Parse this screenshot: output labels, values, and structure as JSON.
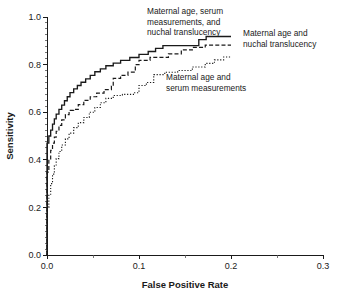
{
  "chart_data": {
    "type": "line",
    "title": "",
    "xlabel": "False Positive Rate",
    "ylabel": "Sensitivity",
    "xlim": [
      0.0,
      0.3
    ],
    "ylim": [
      0.0,
      1.0
    ],
    "grid": false,
    "legend_position": "inline-annotations",
    "x_ticks": [
      "0.0",
      "0.1",
      "0.2",
      "0.3"
    ],
    "x_tick_values": [
      0.0,
      0.1,
      0.2,
      0.3
    ],
    "x_minor_tick_values": [
      0.05,
      0.15,
      0.25
    ],
    "y_ticks": [
      "0.0",
      "0.2",
      "0.4",
      "0.6",
      "0.8",
      "1.0"
    ],
    "y_tick_values": [
      0.0,
      0.2,
      0.4,
      0.6,
      0.8,
      1.0
    ],
    "y_minor_step": 0.025,
    "series": [
      {
        "name": "Maternal age, serum measurements, and nuchal translucency",
        "style": "solid",
        "points": [
          [
            0.0,
            0.0
          ],
          [
            0.0,
            0.47
          ],
          [
            0.002,
            0.47
          ],
          [
            0.002,
            0.5
          ],
          [
            0.004,
            0.5
          ],
          [
            0.004,
            0.525
          ],
          [
            0.006,
            0.525
          ],
          [
            0.006,
            0.55
          ],
          [
            0.008,
            0.55
          ],
          [
            0.008,
            0.572
          ],
          [
            0.01,
            0.572
          ],
          [
            0.01,
            0.592
          ],
          [
            0.013,
            0.592
          ],
          [
            0.013,
            0.612
          ],
          [
            0.016,
            0.612
          ],
          [
            0.016,
            0.63
          ],
          [
            0.019,
            0.63
          ],
          [
            0.019,
            0.648
          ],
          [
            0.022,
            0.648
          ],
          [
            0.022,
            0.665
          ],
          [
            0.025,
            0.665
          ],
          [
            0.025,
            0.682
          ],
          [
            0.029,
            0.682
          ],
          [
            0.029,
            0.698
          ],
          [
            0.033,
            0.698
          ],
          [
            0.033,
            0.712
          ],
          [
            0.037,
            0.712
          ],
          [
            0.037,
            0.726
          ],
          [
            0.042,
            0.726
          ],
          [
            0.042,
            0.74
          ],
          [
            0.047,
            0.74
          ],
          [
            0.047,
            0.755
          ],
          [
            0.052,
            0.755
          ],
          [
            0.052,
            0.77
          ],
          [
            0.058,
            0.77
          ],
          [
            0.058,
            0.782
          ],
          [
            0.064,
            0.782
          ],
          [
            0.064,
            0.795
          ],
          [
            0.072,
            0.795
          ],
          [
            0.072,
            0.806
          ],
          [
            0.08,
            0.806
          ],
          [
            0.08,
            0.818
          ],
          [
            0.09,
            0.818
          ],
          [
            0.09,
            0.83
          ],
          [
            0.1,
            0.83
          ],
          [
            0.1,
            0.843
          ],
          [
            0.11,
            0.843
          ],
          [
            0.11,
            0.855
          ],
          [
            0.118,
            0.855
          ],
          [
            0.118,
            0.868
          ],
          [
            0.126,
            0.868
          ],
          [
            0.126,
            0.88
          ],
          [
            0.165,
            0.88
          ],
          [
            0.165,
            0.905
          ],
          [
            0.173,
            0.905
          ],
          [
            0.173,
            0.918
          ],
          [
            0.2,
            0.918
          ]
        ]
      },
      {
        "name": "Maternal age and nuchal translucency",
        "style": "dashed",
        "points": [
          [
            0.0,
            0.0
          ],
          [
            0.0,
            0.348
          ],
          [
            0.002,
            0.348
          ],
          [
            0.002,
            0.4
          ],
          [
            0.004,
            0.4
          ],
          [
            0.004,
            0.44
          ],
          [
            0.006,
            0.44
          ],
          [
            0.006,
            0.47
          ],
          [
            0.008,
            0.47
          ],
          [
            0.008,
            0.495
          ],
          [
            0.01,
            0.495
          ],
          [
            0.01,
            0.52
          ],
          [
            0.013,
            0.52
          ],
          [
            0.013,
            0.545
          ],
          [
            0.016,
            0.545
          ],
          [
            0.016,
            0.568
          ],
          [
            0.02,
            0.568
          ],
          [
            0.02,
            0.59
          ],
          [
            0.024,
            0.59
          ],
          [
            0.024,
            0.608
          ],
          [
            0.029,
            0.608
          ],
          [
            0.029,
            0.612
          ],
          [
            0.034,
            0.612
          ],
          [
            0.034,
            0.632
          ],
          [
            0.04,
            0.632
          ],
          [
            0.04,
            0.65
          ],
          [
            0.047,
            0.65
          ],
          [
            0.047,
            0.665
          ],
          [
            0.054,
            0.665
          ],
          [
            0.054,
            0.68
          ],
          [
            0.062,
            0.68
          ],
          [
            0.062,
            0.695
          ],
          [
            0.07,
            0.695
          ],
          [
            0.07,
            0.71
          ],
          [
            0.072,
            0.71
          ],
          [
            0.072,
            0.742
          ],
          [
            0.08,
            0.742
          ],
          [
            0.08,
            0.755
          ],
          [
            0.088,
            0.755
          ],
          [
            0.088,
            0.768
          ],
          [
            0.096,
            0.768
          ],
          [
            0.096,
            0.8
          ],
          [
            0.1,
            0.8
          ],
          [
            0.1,
            0.818
          ],
          [
            0.112,
            0.818
          ],
          [
            0.112,
            0.83
          ],
          [
            0.132,
            0.83
          ],
          [
            0.132,
            0.845
          ],
          [
            0.146,
            0.845
          ],
          [
            0.146,
            0.862
          ],
          [
            0.158,
            0.862
          ],
          [
            0.158,
            0.872
          ],
          [
            0.172,
            0.872
          ],
          [
            0.172,
            0.882
          ],
          [
            0.2,
            0.882
          ]
        ]
      },
      {
        "name": "Maternal age and serum measurements",
        "style": "dotted",
        "points": [
          [
            0.0,
            0.0
          ],
          [
            0.0,
            0.2
          ],
          [
            0.002,
            0.2
          ],
          [
            0.002,
            0.255
          ],
          [
            0.004,
            0.255
          ],
          [
            0.004,
            0.3
          ],
          [
            0.006,
            0.3
          ],
          [
            0.006,
            0.34
          ],
          [
            0.008,
            0.34
          ],
          [
            0.008,
            0.375
          ],
          [
            0.01,
            0.375
          ],
          [
            0.01,
            0.405
          ],
          [
            0.013,
            0.405
          ],
          [
            0.013,
            0.435
          ],
          [
            0.016,
            0.435
          ],
          [
            0.016,
            0.462
          ],
          [
            0.02,
            0.462
          ],
          [
            0.02,
            0.488
          ],
          [
            0.024,
            0.488
          ],
          [
            0.024,
            0.512
          ],
          [
            0.029,
            0.512
          ],
          [
            0.029,
            0.535
          ],
          [
            0.034,
            0.535
          ],
          [
            0.034,
            0.556
          ],
          [
            0.04,
            0.556
          ],
          [
            0.04,
            0.578
          ],
          [
            0.046,
            0.578
          ],
          [
            0.046,
            0.6
          ],
          [
            0.052,
            0.6
          ],
          [
            0.052,
            0.62
          ],
          [
            0.058,
            0.62
          ],
          [
            0.058,
            0.64
          ],
          [
            0.064,
            0.64
          ],
          [
            0.064,
            0.658
          ],
          [
            0.072,
            0.658
          ],
          [
            0.072,
            0.67
          ],
          [
            0.082,
            0.67
          ],
          [
            0.082,
            0.675
          ],
          [
            0.094,
            0.675
          ],
          [
            0.094,
            0.682
          ],
          [
            0.1,
            0.682
          ],
          [
            0.1,
            0.712
          ],
          [
            0.108,
            0.712
          ],
          [
            0.108,
            0.725
          ],
          [
            0.116,
            0.725
          ],
          [
            0.116,
            0.758
          ],
          [
            0.128,
            0.758
          ],
          [
            0.128,
            0.768
          ],
          [
            0.142,
            0.768
          ],
          [
            0.142,
            0.775
          ],
          [
            0.158,
            0.775
          ],
          [
            0.158,
            0.79
          ],
          [
            0.172,
            0.79
          ],
          [
            0.172,
            0.805
          ],
          [
            0.182,
            0.805
          ],
          [
            0.182,
            0.82
          ],
          [
            0.192,
            0.82
          ],
          [
            0.192,
            0.832
          ],
          [
            0.2,
            0.832
          ]
        ]
      }
    ],
    "annotations": [
      {
        "id": "annotation-combined",
        "lines": [
          "Maternal age, serum",
          "measurements, and",
          "nuchal translucency"
        ],
        "x": 147,
        "y": 14
      },
      {
        "id": "annotation-nt",
        "lines": [
          "Maternal age and",
          "nuchal translucency"
        ],
        "x": 243,
        "y": 36
      },
      {
        "id": "annotation-serum",
        "lines": [
          "Maternal age and",
          "serum measurements"
        ],
        "x": 166,
        "y": 80
      }
    ],
    "colors": {
      "line": "#1a1a1a",
      "text": "#1a1a1a",
      "background": "#ffffff"
    }
  }
}
